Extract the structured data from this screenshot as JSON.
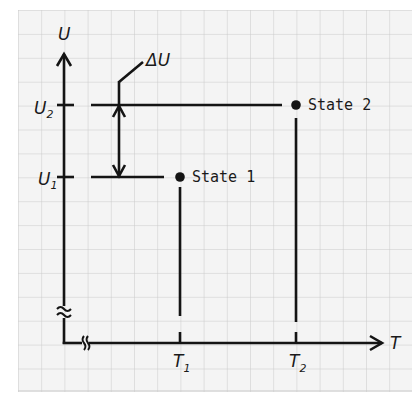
{
  "diagram": {
    "axes": {
      "y_label": "U",
      "x_label": "T",
      "y_break_symbol": "≈",
      "x_break_symbol": "//"
    },
    "y_ticks": [
      {
        "base": "U",
        "sub": "2"
      },
      {
        "base": "U",
        "sub": "1"
      }
    ],
    "x_ticks": [
      {
        "base": "T",
        "sub": "1"
      },
      {
        "base": "T",
        "sub": "2"
      }
    ],
    "states": [
      {
        "label": "State 1"
      },
      {
        "label": "State 2"
      }
    ],
    "delta_label": "ΔU",
    "colors": {
      "ink": "#141414",
      "grid": "#c9c9c9",
      "background": "#f4f4f4"
    }
  }
}
